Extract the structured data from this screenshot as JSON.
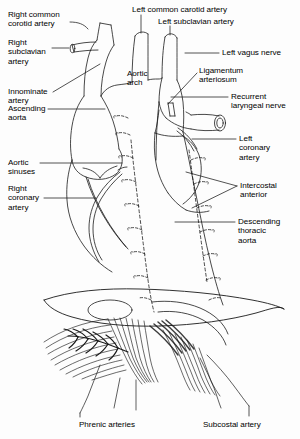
{
  "figure": {
    "style": "black-and-white anatomical line drawing",
    "background_color": "#fdfdfd",
    "ink_color": "#000000"
  },
  "labels": {
    "right_common_carotid": "Right common\ncorotid artery",
    "right_subclavian": "Right\nsubclavian\nartery",
    "innominate": "Innominate\nartery",
    "ascending_aorta": "Ascending\naorta",
    "aortic_sinuses": "Aortic\nsinuses",
    "right_coronary": "Right\ncoronary\nartery",
    "left_common_carotid": "Left common carotid artery",
    "left_subclavian": "Left subclavian artery",
    "aortic_arch": "Aortic\narch",
    "left_vagus": "Left vagus nerve",
    "ligamentum_arteriosum": "Ligamentum\narteriosum",
    "recurrent_laryngeal": "Recurrent\nlaryngeal nerve",
    "left_coronary": "Left\ncoronary\nartery",
    "intercostal_anterior": "Intercostal\nanterior",
    "descending_thoracic_aorta": "Descending\nthoracic\naorta",
    "phrenic_arteries": "Phrenic arteries",
    "subcostal_artery": "Subcostal artery"
  }
}
